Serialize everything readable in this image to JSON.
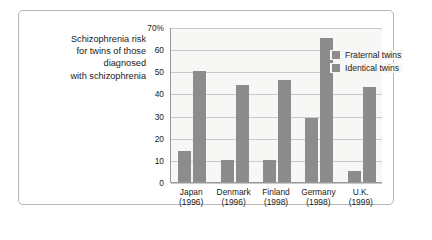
{
  "caption": {
    "lines": [
      "Schizophrenia risk",
      "for twins of those",
      "diagnosed",
      "with schizophrenia"
    ]
  },
  "chart_data": {
    "type": "bar",
    "title": "Schizophrenia risk for twins of those diagnosed with schizophrenia",
    "xlabel": "",
    "ylabel": "",
    "ylim": [
      0,
      70
    ],
    "grid": true,
    "legend_position": "top-left",
    "categories": [
      "Japan\n(1996)",
      "Denmark\n(1996)",
      "Finland\n(1998)",
      "Germany\n(1998)",
      "U.K.\n(1999)"
    ],
    "category_names": [
      "Japan",
      "Denmark",
      "Finland",
      "Germany",
      "U.K."
    ],
    "category_years": [
      "(1996)",
      "(1996)",
      "(1998)",
      "(1998)",
      "(1999)"
    ],
    "ytick_labels": [
      "0",
      "10",
      "20",
      "30",
      "40",
      "50",
      "60",
      "70%"
    ],
    "ytick_values": [
      0,
      10,
      20,
      30,
      40,
      50,
      60,
      70
    ],
    "series": [
      {
        "name": "Fraternal twins",
        "values": [
          14,
          10,
          10,
          29,
          5
        ],
        "color": "#8c8c8c"
      },
      {
        "name": "Identical twins",
        "values": [
          50,
          44,
          46,
          65,
          43
        ],
        "color": "#8c8c8c"
      }
    ]
  },
  "legend": {
    "items": [
      {
        "label": "Fraternal twins"
      },
      {
        "label": "Identical twins"
      }
    ]
  },
  "colors": {
    "bar": "#8c8c8c",
    "plot_background": "#f7f7f5",
    "gridline": "#c9c9c9",
    "axis": "#9a9a9a",
    "frame": "#b5b5b5",
    "text": "#1a1a1a"
  }
}
